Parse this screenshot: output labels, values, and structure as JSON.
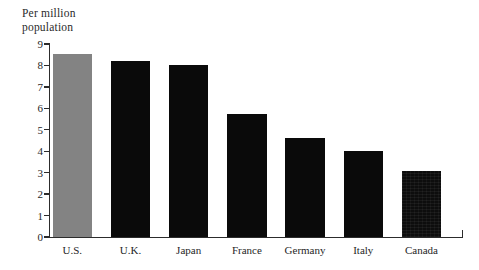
{
  "chart_data": {
    "type": "bar",
    "title": "Per million\npopulation",
    "xlabel": "",
    "ylabel": "",
    "categories": [
      "U.S.",
      "U.K.",
      "Japan",
      "France",
      "Germany",
      "Italy",
      "Canada"
    ],
    "values": [
      8.5,
      8.2,
      8.0,
      5.7,
      4.6,
      4.0,
      3.05
    ],
    "ylim": [
      0,
      9
    ],
    "ytick_labels": [
      "0",
      "1",
      "2",
      "3",
      "4",
      "5",
      "6",
      "7",
      "8",
      "9"
    ],
    "ytick_values": [
      0,
      1,
      2,
      3,
      4,
      5,
      6,
      7,
      8,
      9
    ],
    "grid": false,
    "legend": null,
    "bar_colors": [
      "#838383",
      "#0a0a0a",
      "#0a0a0a",
      "#0a0a0a",
      "#0a0a0a",
      "#0a0a0a",
      "#0d0d0d"
    ],
    "highlight_color": "#838383",
    "series_color": "#0a0a0a",
    "axis_color": "#2c2c2c",
    "background": "#ffffff"
  }
}
